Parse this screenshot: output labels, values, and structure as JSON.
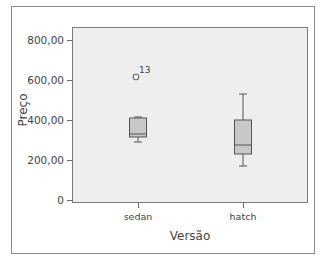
{
  "chart_data": {
    "type": "box",
    "title": "",
    "xlabel": "Versão",
    "ylabel": "Preço",
    "ylim": [
      0,
      850
    ],
    "yticks": [
      {
        "value": 0,
        "label": "0"
      },
      {
        "value": 200,
        "label": "200,00"
      },
      {
        "value": 400,
        "label": "400,00"
      },
      {
        "value": 600,
        "label": "600,00"
      },
      {
        "value": 800,
        "label": "800,00"
      }
    ],
    "categories": [
      "sedan",
      "hatch"
    ],
    "series": [
      {
        "name": "sedan",
        "whisker_low": 290,
        "q1": 315,
        "median": 330,
        "q3": 410,
        "whisker_high": 415,
        "outliers": [
          {
            "value": 615,
            "label": "13"
          }
        ]
      },
      {
        "name": "hatch",
        "whisker_low": 170,
        "q1": 230,
        "median": 275,
        "q3": 400,
        "whisker_high": 530,
        "outliers": []
      }
    ],
    "grid": false,
    "colors": {
      "plot_bg": "#eeeeee",
      "box_fill": "#c8c8c8",
      "line": "#555555"
    }
  }
}
